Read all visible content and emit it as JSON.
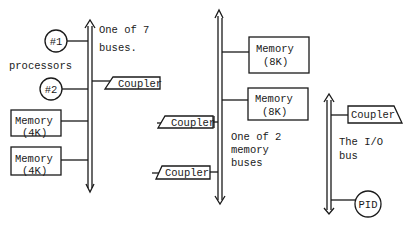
{
  "diagram": {
    "processor_bus": {
      "label_line1": "One of 7",
      "label_line2": "buses.",
      "processors_label": "processors",
      "processor1": "#1",
      "processor2": "#2",
      "coupler": "Coupler",
      "memory1_line1": "Memory",
      "memory1_line2": "(4K)",
      "memory2_line1": "Memory",
      "memory2_line2": "(4K)"
    },
    "memory_bus": {
      "label_line1": "One of 2",
      "label_line2": "memory",
      "label_line3": "buses",
      "memory1_line1": "Memory",
      "memory1_line2": "(8K)",
      "memory2_line1": "Memory",
      "memory2_line2": "(8K)",
      "coupler1": "Coupler",
      "coupler2": "Coupler"
    },
    "io_bus": {
      "label_line1": "The I/O",
      "label_line2": "bus",
      "coupler": "Coupler",
      "pid": "PID"
    }
  }
}
